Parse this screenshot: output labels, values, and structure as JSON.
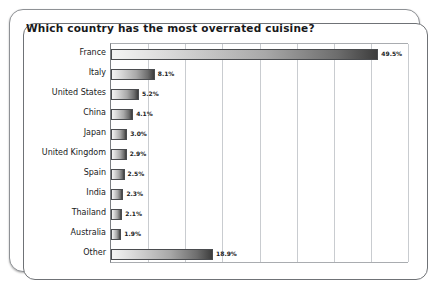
{
  "chart_data": {
    "type": "bar",
    "orientation": "horizontal",
    "title": "Which country has the most overrated cuisine?",
    "xlabel": "",
    "ylabel": "",
    "xlim": [
      0,
      55
    ],
    "grid": true,
    "gridlines": [
      0,
      6.875,
      13.75,
      20.625,
      27.5,
      34.375,
      41.25,
      48.125,
      55
    ],
    "legend": null,
    "categories": [
      "France",
      "Italy",
      "United States",
      "China",
      "Japan",
      "United Kingdom",
      "Spain",
      "India",
      "Thailand",
      "Australia",
      "Other"
    ],
    "values": [
      49.5,
      8.1,
      5.2,
      4.1,
      3.0,
      2.9,
      2.5,
      2.3,
      2.1,
      1.9,
      18.9
    ],
    "value_labels": [
      "49.5%",
      "8.1%",
      "5.2%",
      "4.1%",
      "3.0%",
      "2.9%",
      "2.5%",
      "2.3%",
      "2.1%",
      "1.9%",
      "18.9%"
    ]
  },
  "style": {
    "bar_fill_light": "#f4f4f4",
    "bar_fill_dark": "#3d3d3d",
    "bar_border": "#4a4c4f",
    "gridline_color": "#c9ccd0",
    "axis_color": "#7c7f83",
    "text_color": "#18191b",
    "frame_color": "#8e9195",
    "background": "#ffffff"
  }
}
